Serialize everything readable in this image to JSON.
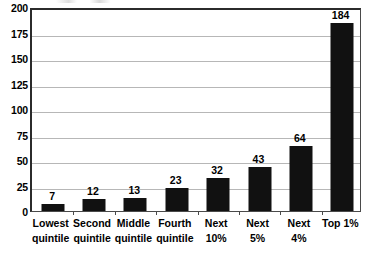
{
  "chart_data": {
    "type": "bar",
    "title": "",
    "xlabel": "",
    "ylabel": "",
    "categories": [
      "Lowest quintile",
      "Second quintile",
      "Middle quintile",
      "Fourth quintile",
      "Next 10%",
      "Next 5%",
      "Next 4%",
      "Top 1%"
    ],
    "category_lines": [
      [
        "Lowest",
        "quintile"
      ],
      [
        "Second",
        "quintile"
      ],
      [
        "Middle",
        "quintile"
      ],
      [
        "Fourth",
        "quintile"
      ],
      [
        "Next",
        "10%"
      ],
      [
        "Next",
        "5%"
      ],
      [
        "Next",
        "4%"
      ],
      [
        "Top 1%",
        ""
      ]
    ],
    "values": [
      7,
      12,
      13,
      23,
      32,
      43,
      64,
      184
    ],
    "data_labels": [
      "7",
      "12",
      "13",
      "23",
      "32",
      "43",
      "64",
      "184"
    ],
    "ylim": [
      0,
      200
    ],
    "ytick_values": [
      0,
      25,
      50,
      75,
      100,
      125,
      150,
      175,
      200
    ],
    "ytick_labels": [
      "0",
      "25",
      "50",
      "75",
      "100",
      "125",
      "150",
      "175",
      "200"
    ],
    "grid": true,
    "legend": false,
    "bar_color": "#111111",
    "gridline_color": "#b7b7b7",
    "axis_color": "#2b2b2b",
    "background_color": "#ffffff"
  }
}
